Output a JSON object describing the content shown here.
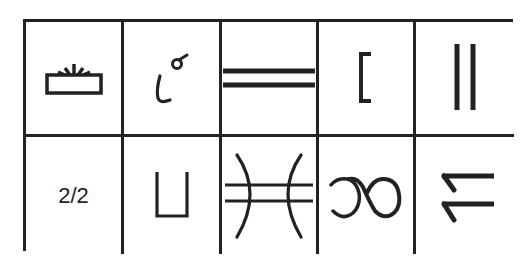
{
  "table": {
    "rows": 2,
    "cols": 5,
    "border_color": "#222222",
    "cells": [
      {
        "row": 0,
        "col": 0,
        "icon": "fixed-box-with-rays-icon",
        "text": ""
      },
      {
        "row": 0,
        "col": 1,
        "icon": "curved-stroke-with-circle-icon",
        "text": ""
      },
      {
        "row": 0,
        "col": 2,
        "icon": "double-horizontal-lines-icon",
        "text": ""
      },
      {
        "row": 0,
        "col": 3,
        "icon": "left-bracket-icon",
        "text": ""
      },
      {
        "row": 0,
        "col": 4,
        "icon": "double-vertical-lines-icon",
        "text": ""
      },
      {
        "row": 1,
        "col": 0,
        "icon": "",
        "text": "2/2"
      },
      {
        "row": 1,
        "col": 1,
        "icon": "open-top-box-icon",
        "text": ""
      },
      {
        "row": 1,
        "col": 2,
        "icon": "arcs-with-double-lines-icon",
        "text": ""
      },
      {
        "row": 1,
        "col": 3,
        "icon": "loop-symbol-icon",
        "text": ""
      },
      {
        "row": 1,
        "col": 4,
        "icon": "double-hooked-lines-icon",
        "text": ""
      }
    ]
  }
}
